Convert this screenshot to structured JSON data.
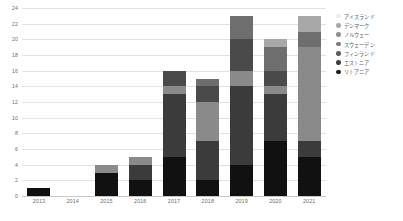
{
  "chart_data": {
    "type": "bar",
    "stacked": true,
    "title": "",
    "subtitle": "",
    "xlabel": "",
    "ylabel": "",
    "categories": [
      "2013",
      "2014",
      "2015",
      "2016",
      "2017",
      "2018",
      "2019",
      "2020",
      "2021"
    ],
    "ylim": [
      0,
      24
    ],
    "ytick_values": [
      0,
      2,
      4,
      6,
      8,
      10,
      12,
      14,
      16,
      18,
      20,
      22,
      24
    ],
    "ytick_labels": [
      "0",
      "2",
      "4",
      "6",
      "8",
      "10",
      "12",
      "14",
      "16",
      "18",
      "20",
      "22",
      "24"
    ],
    "grid": true,
    "grid_axis": "y",
    "legend_position": "right",
    "series": [
      {
        "name": "リトアニア",
        "color": "#111111",
        "values": [
          1,
          0,
          3,
          2,
          5,
          2,
          4,
          7,
          5
        ]
      },
      {
        "name": "エストニア",
        "color": "#3b3b3b",
        "values": [
          0,
          0,
          0,
          2,
          8,
          5,
          10,
          6,
          2
        ]
      },
      {
        "name": "フィンランド",
        "color": "#8a8a8a",
        "values": [
          0,
          0,
          1,
          1,
          1,
          5,
          2,
          1,
          12
        ]
      },
      {
        "name": "スウェーデン",
        "color": "#4a4a4a",
        "values": [
          0,
          0,
          0,
          0,
          2,
          2,
          4,
          2,
          0
        ]
      },
      {
        "name": "ノルウェー",
        "color": "#6e6e6e",
        "values": [
          0,
          0,
          0,
          0,
          0,
          1,
          3,
          3,
          2
        ]
      },
      {
        "name": "デンマーク",
        "color": "#a8a8a8",
        "values": [
          0,
          0,
          0,
          0,
          0,
          0,
          0,
          1,
          2
        ]
      },
      {
        "name": "アイスランド",
        "color": "#ededed",
        "values": [
          0,
          0,
          0,
          0,
          0,
          0,
          0,
          0,
          0
        ]
      }
    ],
    "totals": [
      1,
      0,
      4,
      5,
      16,
      15,
      23,
      20,
      23
    ]
  },
  "legend": {
    "items": [
      {
        "label": "アイスランド",
        "color": "#ededed"
      },
      {
        "label": "デンマーク",
        "color": "#a8a8a8"
      },
      {
        "label": "ノルウェー",
        "color": "#8f8f8f"
      },
      {
        "label": "スウェーデン",
        "color": "#7a7a7a"
      },
      {
        "label": "フィンランド",
        "color": "#5c5c5c"
      },
      {
        "label": "エストニア",
        "color": "#3b3b3b"
      },
      {
        "label": "リトアニア",
        "color": "#1a1a1a"
      }
    ]
  },
  "colors": {
    "background": "#ffffff",
    "gridline": "#e2e2e2",
    "axis": "#c9c9c9",
    "tick_text": "#6d6d6d",
    "legend_text": "#5e5e5e"
  }
}
